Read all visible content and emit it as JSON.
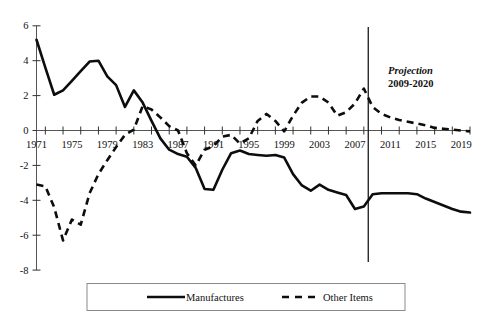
{
  "chart_data": {
    "type": "line",
    "title": "",
    "xlabel": "",
    "ylabel": "",
    "xlim": [
      1971,
      2020
    ],
    "ylim": [
      -8,
      6
    ],
    "grid": false,
    "legend_position": "bottom",
    "y_ticks": [
      "6",
      "4",
      "2",
      "0",
      "-2",
      "-4",
      "-6",
      "-8"
    ],
    "y_tick_values": [
      6,
      4,
      2,
      0,
      -2,
      -4,
      -6,
      -8
    ],
    "x_ticks": [
      "1971",
      "1975",
      "1979",
      "1983",
      "1987",
      "1991",
      "1995",
      "1999",
      "2003",
      "2007",
      "2011",
      "2015",
      "2019"
    ],
    "x_tick_values": [
      1971,
      1975,
      1979,
      1983,
      1987,
      1991,
      1995,
      1999,
      2003,
      2007,
      2011,
      2015,
      2019
    ],
    "x_all_years": [
      1971,
      1972,
      1973,
      1974,
      1975,
      1976,
      1977,
      1978,
      1979,
      1980,
      1981,
      1982,
      1983,
      1984,
      1985,
      1986,
      1987,
      1988,
      1989,
      1990,
      1991,
      1992,
      1993,
      1994,
      1995,
      1996,
      1997,
      1998,
      1999,
      2000,
      2001,
      2002,
      2003,
      2004,
      2005,
      2006,
      2007,
      2008,
      2009,
      2010,
      2011,
      2012,
      2013,
      2014,
      2015,
      2016,
      2017,
      2018,
      2019,
      2020
    ],
    "annotations": [
      {
        "name": "projection-divider",
        "x": 2008.5,
        "label": ""
      }
    ],
    "series": [
      {
        "name": "Manufactures",
        "style": "solid",
        "x": [
          1971,
          1972,
          1973,
          1974,
          1975,
          1976,
          1977,
          1978,
          1979,
          1980,
          1981,
          1982,
          1983,
          1984,
          1985,
          1986,
          1987,
          1988,
          1989,
          1990,
          1991,
          1992,
          1993,
          1994,
          1995,
          1996,
          1997,
          1998,
          1999,
          2000,
          2001,
          2002,
          2003,
          2004,
          2005,
          2006,
          2007,
          2008,
          2009,
          2010,
          2011,
          2012,
          2013,
          2014,
          2015,
          2016,
          2017,
          2018,
          2019,
          2020
        ],
        "values": [
          5.2,
          3.6,
          2.05,
          2.3,
          2.85,
          3.4,
          3.95,
          4.0,
          3.1,
          2.6,
          1.35,
          2.3,
          1.6,
          0.55,
          -0.45,
          -1.1,
          -1.35,
          -1.5,
          -2.15,
          -3.35,
          -3.4,
          -2.25,
          -1.3,
          -1.15,
          -1.35,
          -1.4,
          -1.45,
          -1.4,
          -1.55,
          -2.5,
          -3.15,
          -3.45,
          -3.1,
          -3.4,
          -3.55,
          -3.7,
          -4.5,
          -4.35,
          -3.65,
          -3.6,
          -3.6,
          -3.6,
          -3.6,
          -3.65,
          -3.9,
          -4.1,
          -4.3,
          -4.5,
          -4.65,
          -4.7
        ]
      },
      {
        "name": "Other Items",
        "style": "dashed",
        "x": [
          1971,
          1972,
          1973,
          1974,
          1975,
          1976,
          1977,
          1978,
          1979,
          1980,
          1981,
          1982,
          1983,
          1984,
          1985,
          1986,
          1987,
          1988,
          1989,
          1990,
          1991,
          1992,
          1993,
          1994,
          1995,
          1996,
          1997,
          1998,
          1999,
          2000,
          2001,
          2002,
          2003,
          2004,
          2005,
          2006,
          2007,
          2008,
          2009,
          2010,
          2011,
          2012,
          2013,
          2014,
          2015,
          2016,
          2017,
          2018,
          2019,
          2020
        ],
        "values": [
          -3.1,
          -3.2,
          -4.4,
          -6.3,
          -5.1,
          -5.4,
          -3.6,
          -2.5,
          -1.7,
          -0.95,
          -0.25,
          0.05,
          1.4,
          1.2,
          0.75,
          0.25,
          0.0,
          -1.3,
          -2.0,
          -1.1,
          -0.9,
          -0.35,
          -0.25,
          -0.75,
          -0.45,
          0.55,
          0.95,
          0.55,
          -0.05,
          0.85,
          1.6,
          1.95,
          1.95,
          1.6,
          0.85,
          1.05,
          1.55,
          2.4,
          1.35,
          0.95,
          0.75,
          0.6,
          0.5,
          0.4,
          0.3,
          0.15,
          0.1,
          0.05,
          0.0,
          -0.05
        ]
      }
    ]
  },
  "projection": {
    "title": "Projection",
    "range": "2009-2020"
  },
  "legend": {
    "items": [
      {
        "label": "Manufactures",
        "style": "solid"
      },
      {
        "label": "Other Items",
        "style": "dashed"
      }
    ]
  }
}
